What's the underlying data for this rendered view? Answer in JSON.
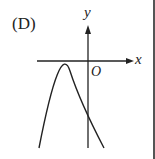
{
  "diagram": {
    "option_label": "(D)",
    "axes": {
      "x_label": "x",
      "y_label": "y",
      "origin_label": "O"
    },
    "curve": {
      "type": "downward-opening parabola",
      "vertex_position": "left of y-axis, below x-axis",
      "y_intercept_position": "below x-axis"
    },
    "colors": {
      "stroke": "#222222",
      "background": "#ffffff"
    }
  }
}
